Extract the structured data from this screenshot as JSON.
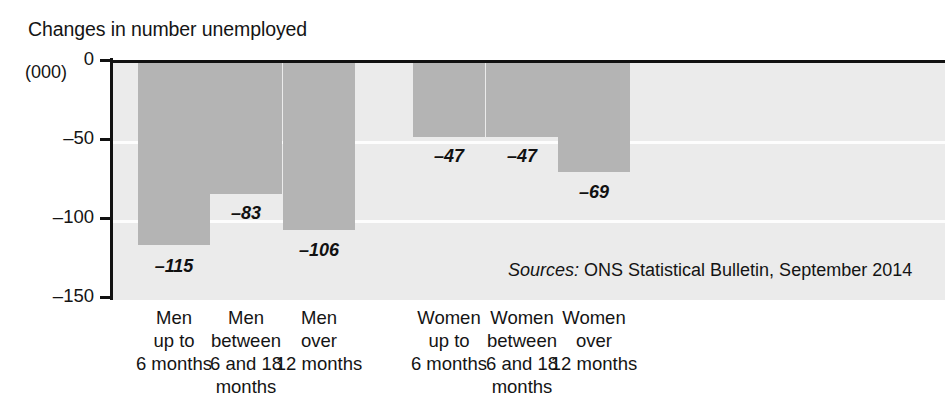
{
  "chart_data": {
    "type": "bar",
    "title": "Changes in number unemployed",
    "xlabel": "",
    "ylabel": "(000)",
    "ylim": [
      -150,
      0
    ],
    "yticks": [
      0,
      -50,
      -100,
      -150
    ],
    "ytick_labels": [
      "0",
      "–50",
      "–100",
      "–150"
    ],
    "grid": true,
    "grid_color": "#fdfdfd",
    "legend": "none",
    "bar_color": "#b4b4b4",
    "plot_background": "#ebebeb",
    "categories": [
      "Men\nup to\n6 months",
      "Men\nbetween\n6 and 18\nmonths",
      "Men\nover\n12 months",
      "Women\nup to\n6 months",
      "Women\nbetween\n6 and 18\nmonths",
      "Women\nover\n12 months"
    ],
    "values": [
      -115,
      -83,
      -106,
      -47,
      -47,
      -69
    ],
    "value_labels": [
      "–115",
      "–83",
      "–106",
      "–47",
      "–47",
      "–69"
    ],
    "annotations": [
      {
        "name": "source-note",
        "label": "Sources:",
        "text": " ONS Statistical Bulletin, September 2014"
      }
    ]
  },
  "source": {
    "label": "Sources:",
    "text": " ONS Statistical Bulletin, September 2014"
  }
}
